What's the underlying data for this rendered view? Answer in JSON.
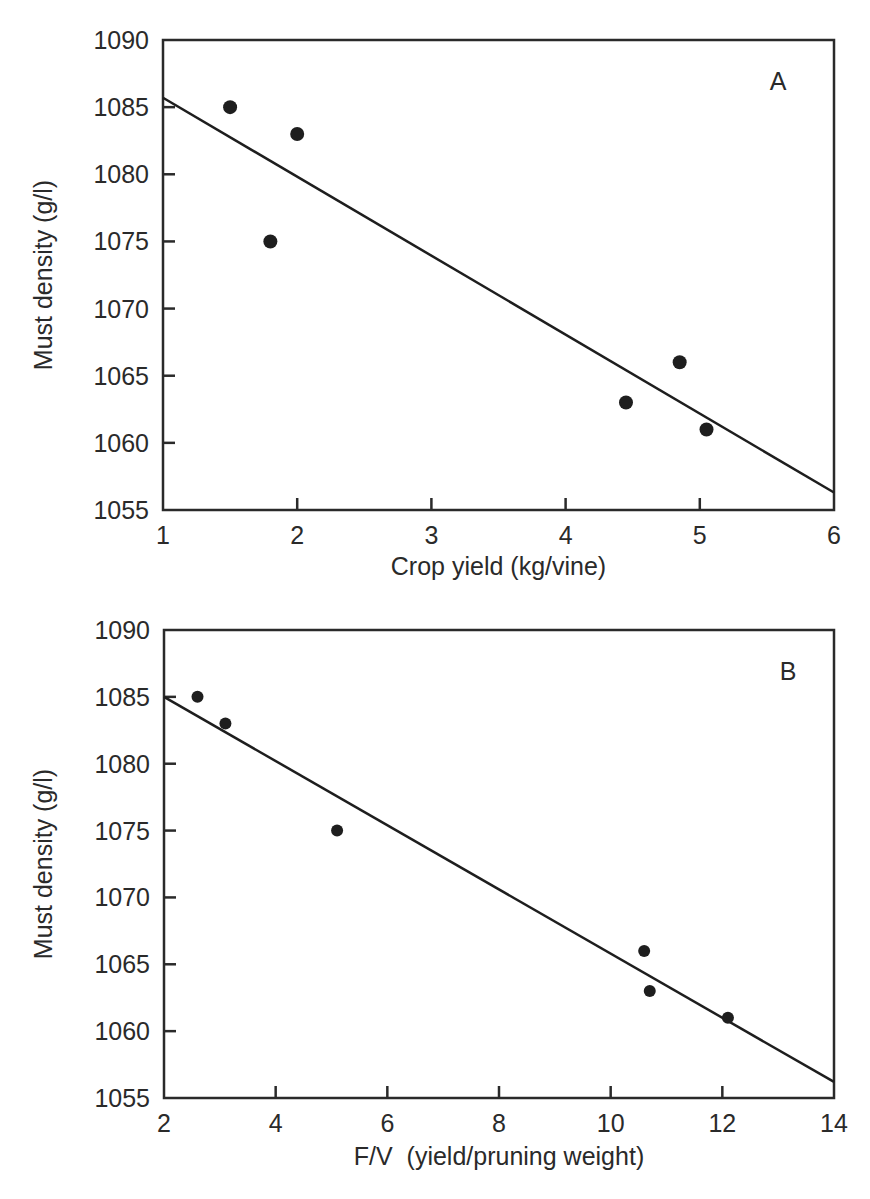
{
  "chart_data": [
    {
      "type": "scatter",
      "panel_label": "A",
      "title": "",
      "xlabel": "Crop yield (kg/vine)",
      "ylabel": "Must density (g/l)",
      "xlim": [
        1,
        6
      ],
      "ylim": [
        1055,
        1090
      ],
      "xticks": [
        1,
        2,
        3,
        4,
        5,
        6
      ],
      "yticks": [
        1055,
        1060,
        1065,
        1070,
        1075,
        1080,
        1085,
        1090
      ],
      "grid": false,
      "legend": null,
      "series": [
        {
          "name": "observations",
          "x": [
            1.5,
            2.0,
            1.8,
            4.45,
            4.85,
            5.05
          ],
          "y": [
            1085,
            1083,
            1075,
            1063,
            1066,
            1061
          ]
        }
      ],
      "regression_line": {
        "x": [
          1,
          6
        ],
        "y": [
          1085.7,
          1056.3
        ]
      }
    },
    {
      "type": "scatter",
      "panel_label": "B",
      "title": "",
      "xlabel": "F/V  (yield/pruning weight)",
      "ylabel": "Must density (g/l)",
      "xlim": [
        2,
        14
      ],
      "ylim": [
        1055,
        1090
      ],
      "xticks": [
        2,
        4,
        6,
        8,
        10,
        12,
        14
      ],
      "yticks": [
        1055,
        1060,
        1065,
        1070,
        1075,
        1080,
        1085,
        1090
      ],
      "grid": false,
      "legend": null,
      "series": [
        {
          "name": "observations",
          "x": [
            2.6,
            3.1,
            5.1,
            10.6,
            10.7,
            12.1
          ],
          "y": [
            1085,
            1083,
            1075,
            1066,
            1063,
            1061
          ]
        }
      ],
      "regression_line": {
        "x": [
          2,
          14
        ],
        "y": [
          1085.0,
          1056.2
        ]
      }
    }
  ]
}
